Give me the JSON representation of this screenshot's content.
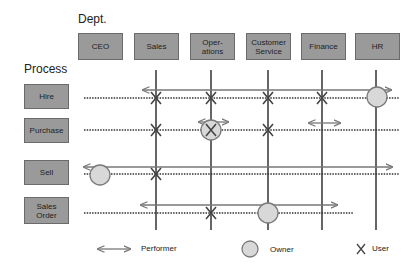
{
  "headers": {
    "dept": "Dept.",
    "process": "Process"
  },
  "departments": [
    {
      "label": "CEO",
      "x": 78
    },
    {
      "label": "Sales",
      "x": 134
    },
    {
      "label": "Oper-\nations",
      "x": 190
    },
    {
      "label": "Customer\nService",
      "x": 246
    },
    {
      "label": "Finance",
      "x": 301
    },
    {
      "label": "HR",
      "x": 355
    }
  ],
  "processes": [
    {
      "label": "Hire",
      "y": 98
    },
    {
      "label": "Purchase",
      "y": 130
    },
    {
      "label": "Sell",
      "y": 174
    },
    {
      "label": "Sales\nOrder",
      "y": 213
    }
  ],
  "legend": {
    "performer": "Performer",
    "owner": "Owner",
    "user": "User"
  },
  "colors": {
    "box_fill": "#9a9a9a",
    "line": "#333333",
    "arrow": "#777777",
    "owner_fill": "#d8d8d8",
    "owner_stroke": "#7a7a7a"
  },
  "relations": {
    "Hire": {
      "performer": "Sales–HR",
      "owner": "HR",
      "users": [
        "Sales",
        "Operations",
        "Customer Service",
        "Finance"
      ]
    },
    "Purchase": {
      "performer": "Operations; Finance",
      "owner": "Operations",
      "users": [
        "Sales",
        "Operations",
        "Customer Service"
      ]
    },
    "Sell": {
      "performer": "CEO–HR",
      "owner": "CEO",
      "users": [
        "Sales"
      ]
    },
    "Sales Order": {
      "performer": "Sales–Finance",
      "owner": "Customer Service",
      "users": [
        "Operations"
      ]
    }
  }
}
